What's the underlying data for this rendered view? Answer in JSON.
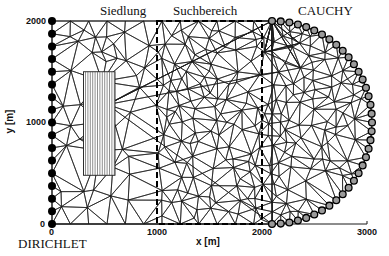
{
  "figure": {
    "type": "finite-element mesh diagram",
    "region_labels": {
      "settlement": "Siedlung",
      "search_area": "Suchbereich",
      "cauchy": "CAUCHY",
      "dirichlet": "DIRICHLET"
    },
    "x_axis": {
      "title": "x [m]",
      "ticks": [
        "0",
        "1000",
        "2000",
        "3000"
      ]
    },
    "y_axis": {
      "title": "y [m]",
      "ticks": [
        "0",
        "1000",
        "2000"
      ]
    },
    "domain": {
      "x_range_m": [
        0,
        3000
      ],
      "y_range_m": [
        0,
        2000
      ],
      "search_area_x_m": [
        1000,
        2000
      ],
      "settlement_rect_m": {
        "x": [
          300,
          600
        ],
        "y": [
          480,
          1500
        ]
      },
      "dirichlet_nodes": 17,
      "cauchy_nodes": 36
    },
    "colors": {
      "mesh": "#1a1a1a",
      "background": "#ffffff",
      "dirichlet_node": "#000000",
      "cauchy_node_fill": "#9a9a9a"
    }
  }
}
